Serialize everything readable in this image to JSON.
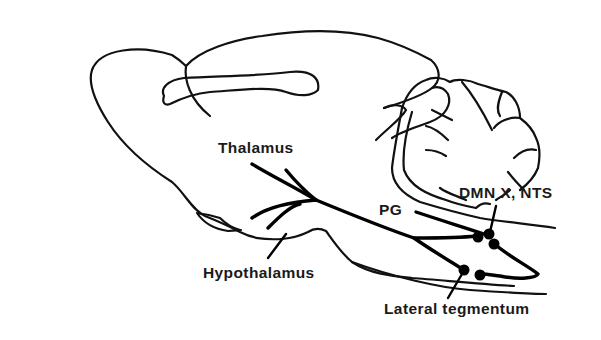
{
  "diagram": {
    "type": "brain-sagittal-section",
    "colors": {
      "line": "#111111",
      "background": "#ffffff",
      "text": "#1a1a1a"
    },
    "labels": {
      "thalamus": "Thalamus",
      "pg": "PG",
      "dmn_x_nts": "DMN X, NTS",
      "hypothalamus": "Hypothalamus",
      "lateral_tegmentum": "Lateral tegmentum"
    },
    "structures": [
      {
        "name": "cerebral-hemisphere",
        "kind": "outline"
      },
      {
        "name": "olfactory-bulb",
        "kind": "outline"
      },
      {
        "name": "corpus-callosum",
        "kind": "outline"
      },
      {
        "name": "cerebellum",
        "kind": "outline"
      },
      {
        "name": "brainstem",
        "kind": "outline"
      },
      {
        "name": "pathway-fibers",
        "kind": "projection"
      }
    ],
    "nuclei_count": 5
  }
}
